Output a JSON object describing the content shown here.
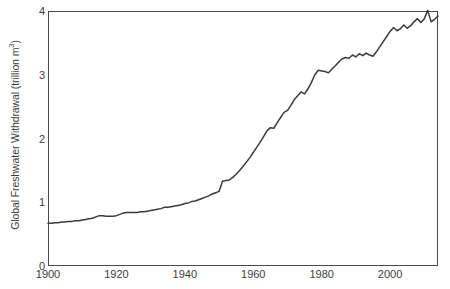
{
  "chart_data": {
    "type": "line",
    "title": "",
    "subtitle": "",
    "xlabel": "",
    "ylabel": "Global Freshwater Withdrawal (trillion m3)",
    "ylabel_text": "Global Freshwater Withdrawal (trillion m",
    "ylabel_superscript": "3",
    "ylabel_suffix": ")",
    "xlim": [
      1900,
      2014
    ],
    "ylim": [
      0,
      4
    ],
    "xticks": [
      1900,
      1920,
      1940,
      1960,
      1980,
      2000
    ],
    "xtick_labels": [
      "1900",
      "1920",
      "1940",
      "1960",
      "1980",
      "2000"
    ],
    "yticks": [
      0,
      1,
      2,
      3,
      4
    ],
    "ytick_labels": [
      "0",
      "1",
      "2",
      "3",
      "4"
    ],
    "grid": false,
    "legend": null,
    "line_color": "#3a3a3a",
    "line_width": 1.5,
    "frame_color": "#4a4a4a",
    "background": "#ffffff",
    "series": [
      {
        "name": "Global Freshwater Withdrawal",
        "x": [
          1900,
          1901,
          1902,
          1903,
          1904,
          1905,
          1906,
          1907,
          1908,
          1909,
          1910,
          1911,
          1912,
          1913,
          1914,
          1915,
          1916,
          1917,
          1918,
          1919,
          1920,
          1921,
          1922,
          1923,
          1924,
          1925,
          1926,
          1927,
          1928,
          1929,
          1930,
          1931,
          1932,
          1933,
          1934,
          1935,
          1936,
          1937,
          1938,
          1939,
          1940,
          1941,
          1942,
          1943,
          1944,
          1945,
          1946,
          1947,
          1948,
          1949,
          1950,
          1951,
          1952,
          1953,
          1954,
          1955,
          1956,
          1957,
          1958,
          1959,
          1960,
          1961,
          1962,
          1963,
          1964,
          1965,
          1966,
          1967,
          1968,
          1969,
          1970,
          1971,
          1972,
          1973,
          1974,
          1975,
          1976,
          1977,
          1978,
          1979,
          1980,
          1981,
          1982,
          1983,
          1984,
          1985,
          1986,
          1987,
          1988,
          1989,
          1990,
          1991,
          1992,
          1993,
          1994,
          1995,
          1996,
          1997,
          1998,
          1999,
          2000,
          2001,
          2002,
          2003,
          2004,
          2005,
          2006,
          2007,
          2008,
          2009,
          2010,
          2011,
          2012,
          2013,
          2014
        ],
        "y": [
          0.67,
          0.67,
          0.68,
          0.68,
          0.69,
          0.69,
          0.7,
          0.7,
          0.71,
          0.71,
          0.72,
          0.73,
          0.74,
          0.75,
          0.77,
          0.79,
          0.79,
          0.78,
          0.78,
          0.78,
          0.79,
          0.81,
          0.83,
          0.84,
          0.84,
          0.84,
          0.84,
          0.85,
          0.85,
          0.86,
          0.87,
          0.88,
          0.89,
          0.9,
          0.92,
          0.92,
          0.93,
          0.94,
          0.95,
          0.96,
          0.98,
          0.99,
          1.01,
          1.02,
          1.04,
          1.06,
          1.08,
          1.1,
          1.13,
          1.15,
          1.17,
          1.33,
          1.34,
          1.35,
          1.39,
          1.44,
          1.5,
          1.56,
          1.63,
          1.7,
          1.78,
          1.86,
          1.94,
          2.03,
          2.12,
          2.17,
          2.16,
          2.25,
          2.33,
          2.41,
          2.44,
          2.52,
          2.61,
          2.67,
          2.73,
          2.7,
          2.78,
          2.88,
          3.0,
          3.07,
          3.06,
          3.05,
          3.03,
          3.09,
          3.14,
          3.2,
          3.25,
          3.27,
          3.26,
          3.31,
          3.28,
          3.33,
          3.3,
          3.34,
          3.31,
          3.29,
          3.36,
          3.44,
          3.52,
          3.6,
          3.68,
          3.74,
          3.69,
          3.72,
          3.78,
          3.73,
          3.77,
          3.83,
          3.88,
          3.82,
          3.88,
          4.01,
          3.83,
          3.87,
          3.92
        ]
      }
    ],
    "annotations": [
      {
        "text": "Sharp step increase around 1950-1951",
        "x": 1951,
        "y": 1.33
      },
      {
        "text": "Peak value near 2011",
        "x": 2011,
        "y": 4.01
      }
    ]
  },
  "figure": {
    "width": 450,
    "height": 289
  }
}
